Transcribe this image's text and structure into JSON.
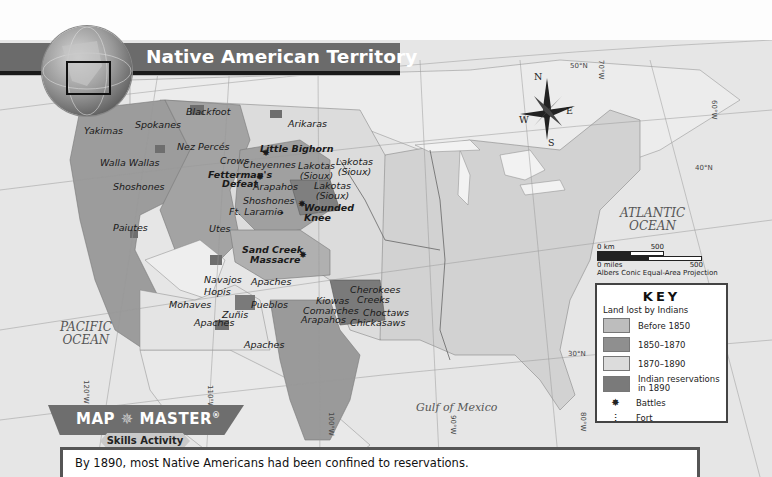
{
  "title": "Native American Territory",
  "oceans": {
    "pacific": "PACIFIC\nOCEAN",
    "pacific_line1": "PACIFIC",
    "pacific_line2": "OCEAN",
    "atlantic_line1": "ATLANTIC",
    "atlantic_line2": "OCEAN",
    "gulf": "Gulf of Mexico"
  },
  "compass": {
    "n": "N",
    "s": "S",
    "e": "E",
    "w": "W"
  },
  "coordinates": {
    "lat50": "50°N",
    "lat40": "40°N",
    "lat30": "30°N",
    "lon70": "70°W",
    "lon60": "60°W",
    "lon120": "120°W",
    "lon110": "110°W",
    "lon100": "100°W",
    "lon90": "90°W",
    "lon80": "80°W"
  },
  "tribes": [
    {
      "name": "Blackfoot"
    },
    {
      "name": "Spokanes"
    },
    {
      "name": "Yakimas"
    },
    {
      "name": "Arikaras"
    },
    {
      "name": "Nez Percés"
    },
    {
      "name": "Crows"
    },
    {
      "name": "Cheyennes"
    },
    {
      "name": "Walla Wallas"
    },
    {
      "name": "Lakotas\n(Sioux)"
    },
    {
      "name": "Lakotas"
    },
    {
      "name": "(Sioux)"
    },
    {
      "name": "Shoshones"
    },
    {
      "name": "Arapahos"
    },
    {
      "name": "Shoshones"
    },
    {
      "name": "Lakotas"
    },
    {
      "name": "(Sioux)"
    },
    {
      "name": "Lakotas"
    },
    {
      "name": "(Sioux)"
    },
    {
      "name": "Paiutes"
    },
    {
      "name": "Utes"
    },
    {
      "name": "Navajos"
    },
    {
      "name": "Apaches"
    },
    {
      "name": "Hopis"
    },
    {
      "name": "Mohaves"
    },
    {
      "name": "Zuñis"
    },
    {
      "name": "Pueblos"
    },
    {
      "name": "Apaches"
    },
    {
      "name": "Apaches"
    },
    {
      "name": "Kiowas"
    },
    {
      "name": "Comanches"
    },
    {
      "name": "Arapahos"
    },
    {
      "name": "Cherokees"
    },
    {
      "name": "Creeks"
    },
    {
      "name": "Choctaws"
    },
    {
      "name": "Chickasaws"
    }
  ],
  "events": {
    "little_bighorn": "Little Bighorn",
    "fetterman_1": "Fetterman's",
    "fetterman_2": "Defeat",
    "wounded_1": "Wounded",
    "wounded_2": "Knee",
    "sand_creek_1": "Sand Creek",
    "sand_creek_2": "Massacre",
    "ft_laramie": "Ft. Laramie"
  },
  "rivers": {
    "snake": "Snake R.",
    "missouri": "Missouri R.",
    "mississippi": "Mississippi R.",
    "colorado": "Colorado R.",
    "rio_grande": "Rio Grande"
  },
  "scale": {
    "km_start": "0 km",
    "km_end": "500",
    "mi_start": "0 miles",
    "mi_end": "500",
    "projection": "Albers Conic Equal-Area Projection"
  },
  "key": {
    "title": "KEY",
    "subtitle": "Land lost by Indians",
    "items": [
      {
        "label": "Before 1850",
        "color": "#bdbdbd"
      },
      {
        "label": "1850–1870",
        "color": "#8f8f8f"
      },
      {
        "label": "1870–1890",
        "color": "#dcdcdc"
      },
      {
        "label": "Indian reservations in 1890",
        "color": "#7a7a7a"
      }
    ],
    "symbols": [
      {
        "label": "Battles",
        "icon": "battle-icon"
      },
      {
        "label": "Fort",
        "icon": "fort-icon"
      }
    ]
  },
  "map_master": {
    "title": "MAP",
    "title2": "MASTER",
    "reg": "®",
    "subtitle": "Skills Activity"
  },
  "caption": "By 1890, most Native Americans had been confined to reservations.",
  "colors": {
    "banner": "#6b6b6b",
    "ocean": "#e6e6e6",
    "before1850": "#bdbdbd",
    "y1850_1870": "#8f8f8f",
    "y1870_1890": "#dcdcdc",
    "reservations": "#7a7a7a",
    "east": "#d2d2d2"
  }
}
